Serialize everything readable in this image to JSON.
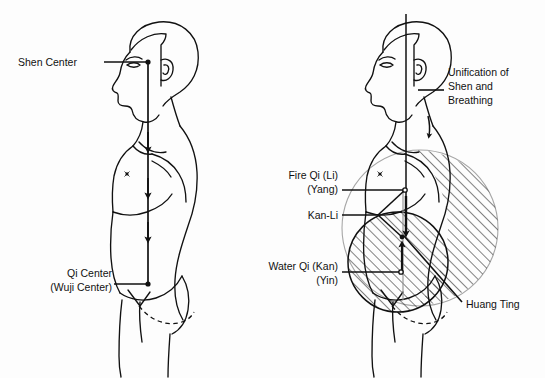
{
  "figure": {
    "background_color": "#fdfdfd",
    "ink_color": "#111111",
    "hatch_color": "#222222",
    "faint_circle_color": "#9a9a9a"
  },
  "left_panel": {
    "name": "shen-to-qi-descent",
    "labels": [
      {
        "id": "shen-center",
        "lines": [
          "Shen Center"
        ],
        "x": 18,
        "y": 66,
        "anchor": "start"
      },
      {
        "id": "qi-center",
        "lines": [
          "Qi Center",
          "(Wuji Center)"
        ],
        "x": 112,
        "y": 277,
        "anchor": "end"
      }
    ],
    "points": [
      {
        "id": "shen-center-point",
        "x": 148,
        "y": 62
      },
      {
        "id": "qi-center-point",
        "x": 148,
        "y": 284
      }
    ],
    "arrow_count": 3,
    "flow_direction": "downward"
  },
  "right_panel": {
    "name": "kan-li-unification",
    "labels": [
      {
        "id": "unification",
        "lines": [
          "Unification of",
          "Shen and",
          "Breathing"
        ],
        "x": 448,
        "y": 76,
        "anchor": "start"
      },
      {
        "id": "fire-qi",
        "lines": [
          "Fire Qi (Li)",
          "(Yang)"
        ],
        "x": 338,
        "y": 174,
        "anchor": "end"
      },
      {
        "id": "kan-li",
        "lines": [
          "Kan-Li"
        ],
        "x": 338,
        "y": 218,
        "anchor": "end"
      },
      {
        "id": "water-qi",
        "lines": [
          "Water Qi (Kan)",
          "(Yin)"
        ],
        "x": 338,
        "y": 270,
        "anchor": "end"
      },
      {
        "id": "huang-ting",
        "lines": [
          "Huang Ting"
        ],
        "x": 466,
        "y": 308,
        "anchor": "start"
      }
    ],
    "points": [
      {
        "id": "fire-qi-point",
        "x": 405,
        "y": 190
      },
      {
        "id": "kan-li-junction",
        "x": 378,
        "y": 215
      },
      {
        "id": "kan-li-point",
        "x": 402,
        "y": 237
      },
      {
        "id": "water-qi-point",
        "x": 401,
        "y": 272
      }
    ],
    "regions": [
      {
        "id": "huang-ting-region",
        "shape": "circle",
        "cx": 420,
        "cy": 228,
        "r": 78,
        "fill": "hatched-right-portion"
      },
      {
        "id": "lower-dantian-region",
        "shape": "circle",
        "cx": 398,
        "cy": 262,
        "r": 50,
        "fill": "hatched"
      }
    ],
    "flow_direction": "converging"
  }
}
